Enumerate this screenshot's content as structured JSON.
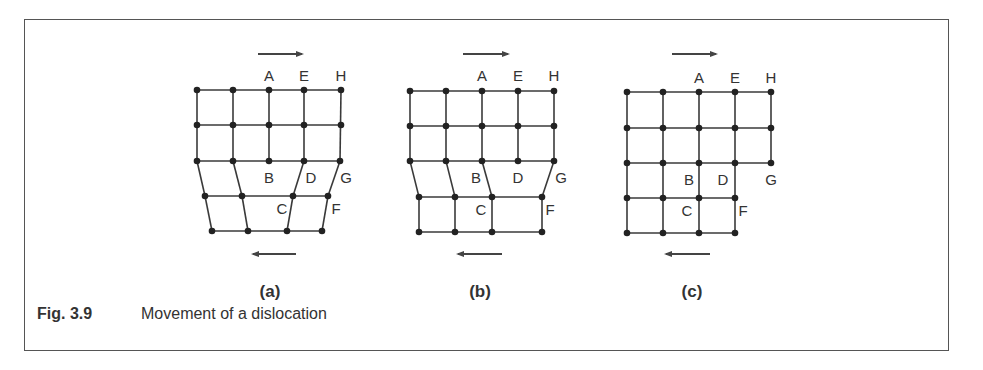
{
  "figure": {
    "number": "Fig. 3.9",
    "caption": "Movement of a dislocation",
    "line_color": "#3a3a3a",
    "node_color": "#222222"
  },
  "panels": [
    {
      "id": "a",
      "label": "(a)",
      "label_pos": [
        270,
        297
      ],
      "top_arrow": {
        "direction": "right",
        "x1": 258,
        "x2": 302,
        "y": 54
      },
      "bottom_arrow": {
        "direction": "left",
        "x1": 296,
        "x2": 253,
        "y": 254
      },
      "rows": [
        [
          [
            197,
            90
          ],
          [
            233,
            90
          ],
          [
            269,
            90
          ],
          [
            304,
            90
          ],
          [
            341,
            90
          ]
        ],
        [
          [
            197,
            125
          ],
          [
            233,
            125
          ],
          [
            269,
            125
          ],
          [
            304,
            125
          ],
          [
            341,
            125
          ]
        ],
        [
          [
            197,
            161
          ],
          [
            233,
            161
          ],
          [
            269,
            161
          ],
          [
            304,
            161
          ],
          [
            340,
            161
          ]
        ],
        [
          [
            205,
            196
          ],
          [
            242,
            196
          ],
          [
            293,
            196
          ],
          [
            328,
            196
          ]
        ],
        [
          [
            212,
            231
          ],
          [
            248,
            231
          ],
          [
            287,
            231
          ],
          [
            322,
            231
          ]
        ]
      ],
      "verticals": [
        [
          [
            197,
            90
          ],
          [
            197,
            161
          ]
        ],
        [
          [
            233,
            90
          ],
          [
            233,
            161
          ]
        ],
        [
          [
            269,
            90
          ],
          [
            269,
            161
          ]
        ],
        [
          [
            304,
            90
          ],
          [
            304,
            161
          ]
        ],
        [
          [
            341,
            90
          ],
          [
            340,
            161
          ]
        ],
        [
          [
            197,
            161
          ],
          [
            205,
            196
          ]
        ],
        [
          [
            233,
            161
          ],
          [
            242,
            196
          ]
        ],
        [
          [
            304,
            161
          ],
          [
            293,
            196
          ]
        ],
        [
          [
            340,
            161
          ],
          [
            328,
            196
          ]
        ],
        [
          [
            205,
            196
          ],
          [
            212,
            231
          ]
        ],
        [
          [
            242,
            196
          ],
          [
            248,
            231
          ]
        ],
        [
          [
            293,
            196
          ],
          [
            287,
            231
          ]
        ],
        [
          [
            328,
            196
          ],
          [
            322,
            231
          ]
        ]
      ],
      "points": [
        {
          "text": "A",
          "x": 269,
          "y": 81
        },
        {
          "text": "E",
          "x": 304,
          "y": 81
        },
        {
          "text": "H",
          "x": 341,
          "y": 81
        },
        {
          "text": "B",
          "x": 269,
          "y": 183
        },
        {
          "text": "D",
          "x": 311,
          "y": 183
        },
        {
          "text": "G",
          "x": 346,
          "y": 183
        },
        {
          "text": "C",
          "x": 282,
          "y": 214
        },
        {
          "text": "F",
          "x": 336,
          "y": 214
        }
      ]
    },
    {
      "id": "b",
      "label": "(b)",
      "label_pos": [
        480,
        297
      ],
      "top_arrow": {
        "direction": "right",
        "x1": 463,
        "x2": 508,
        "y": 54
      },
      "bottom_arrow": {
        "direction": "left",
        "x1": 502,
        "x2": 458,
        "y": 254
      },
      "rows": [
        [
          [
            410,
            91
          ],
          [
            446,
            91
          ],
          [
            482,
            91
          ],
          [
            518,
            91
          ],
          [
            554,
            91
          ]
        ],
        [
          [
            410,
            126
          ],
          [
            446,
            126
          ],
          [
            482,
            126
          ],
          [
            518,
            126
          ],
          [
            554,
            126
          ]
        ],
        [
          [
            410,
            161
          ],
          [
            446,
            161
          ],
          [
            482,
            161
          ],
          [
            518,
            161
          ],
          [
            554,
            161
          ]
        ],
        [
          [
            419,
            197
          ],
          [
            455,
            197
          ],
          [
            492,
            197
          ],
          [
            542,
            197
          ]
        ],
        [
          [
            419,
            232
          ],
          [
            455,
            232
          ],
          [
            492,
            232
          ],
          [
            542,
            232
          ]
        ]
      ],
      "verticals": [
        [
          [
            410,
            91
          ],
          [
            410,
            161
          ]
        ],
        [
          [
            446,
            91
          ],
          [
            446,
            161
          ]
        ],
        [
          [
            482,
            91
          ],
          [
            482,
            161
          ]
        ],
        [
          [
            518,
            91
          ],
          [
            518,
            161
          ]
        ],
        [
          [
            554,
            91
          ],
          [
            554,
            161
          ]
        ],
        [
          [
            410,
            161
          ],
          [
            419,
            197
          ]
        ],
        [
          [
            446,
            161
          ],
          [
            455,
            197
          ]
        ],
        [
          [
            482,
            161
          ],
          [
            492,
            197
          ]
        ],
        [
          [
            554,
            161
          ],
          [
            542,
            197
          ]
        ],
        [
          [
            419,
            197
          ],
          [
            419,
            232
          ]
        ],
        [
          [
            455,
            197
          ],
          [
            455,
            232
          ]
        ],
        [
          [
            492,
            197
          ],
          [
            492,
            232
          ]
        ],
        [
          [
            542,
            197
          ],
          [
            542,
            232
          ]
        ]
      ],
      "points": [
        {
          "text": "A",
          "x": 482,
          "y": 81
        },
        {
          "text": "E",
          "x": 518,
          "y": 81
        },
        {
          "text": "H",
          "x": 554,
          "y": 81
        },
        {
          "text": "B",
          "x": 476,
          "y": 183
        },
        {
          "text": "D",
          "x": 518,
          "y": 183
        },
        {
          "text": "G",
          "x": 561,
          "y": 183
        },
        {
          "text": "C",
          "x": 481,
          "y": 215
        },
        {
          "text": "F",
          "x": 550,
          "y": 215
        }
      ]
    },
    {
      "id": "c",
      "label": "(c)",
      "label_pos": [
        692,
        297
      ],
      "top_arrow": {
        "direction": "right",
        "x1": 672,
        "x2": 716,
        "y": 54
      },
      "bottom_arrow": {
        "direction": "left",
        "x1": 710,
        "x2": 666,
        "y": 254
      },
      "rows": [
        [
          [
            627,
            92
          ],
          [
            663,
            92
          ],
          [
            699,
            92
          ],
          [
            735,
            92
          ],
          [
            771,
            92
          ]
        ],
        [
          [
            627,
            128
          ],
          [
            663,
            128
          ],
          [
            699,
            128
          ],
          [
            735,
            128
          ],
          [
            771,
            128
          ]
        ],
        [
          [
            627,
            163
          ],
          [
            663,
            163
          ],
          [
            699,
            163
          ],
          [
            735,
            163
          ],
          [
            771,
            163
          ]
        ],
        [
          [
            627,
            198
          ],
          [
            663,
            198
          ],
          [
            699,
            198
          ],
          [
            735,
            198
          ]
        ],
        [
          [
            627,
            233
          ],
          [
            663,
            233
          ],
          [
            699,
            233
          ],
          [
            735,
            233
          ]
        ]
      ],
      "verticals": [
        [
          [
            627,
            92
          ],
          [
            627,
            233
          ]
        ],
        [
          [
            663,
            92
          ],
          [
            663,
            233
          ]
        ],
        [
          [
            699,
            92
          ],
          [
            699,
            233
          ]
        ],
        [
          [
            735,
            92
          ],
          [
            735,
            233
          ]
        ],
        [
          [
            771,
            92
          ],
          [
            771,
            163
          ]
        ]
      ],
      "points": [
        {
          "text": "A",
          "x": 699,
          "y": 83
        },
        {
          "text": "E",
          "x": 735,
          "y": 83
        },
        {
          "text": "H",
          "x": 771,
          "y": 83
        },
        {
          "text": "B",
          "x": 689,
          "y": 185
        },
        {
          "text": "D",
          "x": 723,
          "y": 185
        },
        {
          "text": "G",
          "x": 771,
          "y": 185
        },
        {
          "text": "C",
          "x": 687,
          "y": 216
        },
        {
          "text": "F",
          "x": 743,
          "y": 216
        }
      ]
    }
  ]
}
